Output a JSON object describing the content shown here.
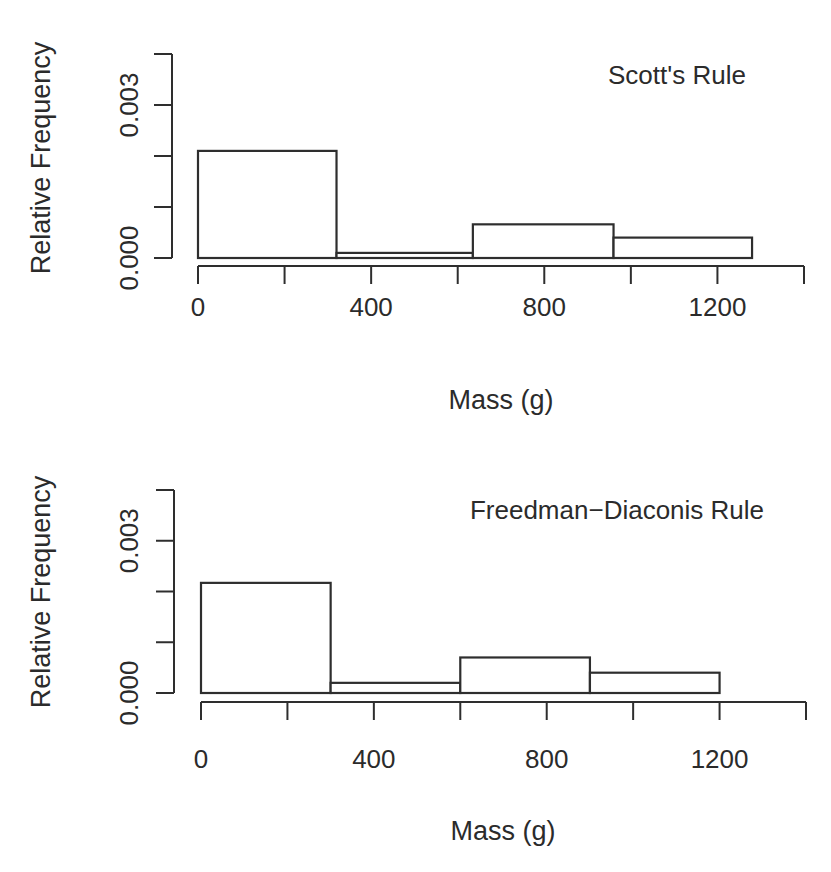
{
  "chart_data": [
    {
      "type": "bar",
      "subtype": "histogram",
      "title": "Scott's Rule",
      "xlabel": "Mass (g)",
      "ylabel": "Relative Frequency",
      "xlim": [
        0,
        1400
      ],
      "ylim": [
        0,
        0.004
      ],
      "x_ticks": [
        0,
        200,
        400,
        600,
        800,
        1000,
        1200,
        1400
      ],
      "x_tick_labels": [
        "0",
        "400",
        "800",
        "1200"
      ],
      "x_tick_label_values": [
        0,
        400,
        800,
        1200
      ],
      "y_ticks": [
        0,
        0.001,
        0.002,
        0.003,
        0.004
      ],
      "y_tick_labels": [
        "0.000",
        "0.003"
      ],
      "y_tick_label_values": [
        0,
        0.003
      ],
      "grid": false,
      "legend": null,
      "bins": [
        {
          "start": 0,
          "end": 320,
          "value": 0.0021
        },
        {
          "start": 320,
          "end": 635,
          "value": 0.0001
        },
        {
          "start": 635,
          "end": 960,
          "value": 0.00066
        },
        {
          "start": 960,
          "end": 1280,
          "value": 0.0004
        }
      ]
    },
    {
      "type": "bar",
      "subtype": "histogram",
      "title": "Freedman−Diaconis Rule",
      "xlabel": "Mass (g)",
      "ylabel": "Relative Frequency",
      "xlim": [
        0,
        1400
      ],
      "ylim": [
        0,
        0.004
      ],
      "x_ticks": [
        0,
        200,
        400,
        600,
        800,
        1000,
        1200,
        1400
      ],
      "x_tick_labels": [
        "0",
        "400",
        "800",
        "1200"
      ],
      "x_tick_label_values": [
        0,
        400,
        800,
        1200
      ],
      "y_ticks": [
        0,
        0.001,
        0.002,
        0.003,
        0.004
      ],
      "y_tick_labels": [
        "0.000",
        "0.003"
      ],
      "y_tick_label_values": [
        0,
        0.003
      ],
      "grid": false,
      "legend": null,
      "bins": [
        {
          "start": 0,
          "end": 300,
          "value": 0.00217
        },
        {
          "start": 300,
          "end": 600,
          "value": 0.0002
        },
        {
          "start": 600,
          "end": 900,
          "value": 0.0007
        },
        {
          "start": 900,
          "end": 1200,
          "value": 0.0004
        }
      ]
    }
  ],
  "layout": {
    "panels": [
      {
        "x0_px": 198,
        "x1400_px": 804,
        "y0_px": 258,
        "y004_px": 54,
        "yaxis_x_px": 172,
        "xaxis_y_px": 266,
        "tick_len": 18,
        "xtick_label_y": 316,
        "xlabel_x": 501,
        "xlabel_y": 409,
        "ylabel_x": 50,
        "ylabel_y": 158,
        "ytick_label_x": 138,
        "title_x": 677,
        "title_y": 84
      },
      {
        "x0_px": 201,
        "x1400_px": 806,
        "y0_px": 693,
        "y004_px": 490,
        "yaxis_x_px": 174,
        "xaxis_y_px": 702,
        "tick_len": 18,
        "xtick_label_y": 768,
        "xlabel_x": 503,
        "xlabel_y": 840,
        "ylabel_x": 50,
        "ylabel_y": 592,
        "ytick_label_x": 138,
        "title_x": 617,
        "title_y": 519
      }
    ]
  }
}
